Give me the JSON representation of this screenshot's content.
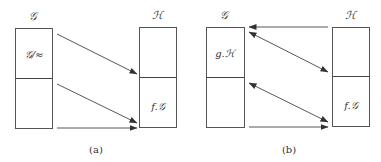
{
  "diagrams": [
    {
      "id": "a",
      "caption": "(a)",
      "left_set": {
        "label": "𝒢",
        "top_label": "𝒢/≈",
        "bottom_label": ""
      },
      "right_set": {
        "label": "ℋ",
        "top_label": "",
        "bottom_label": "f.𝒢"
      },
      "arrows": [
        {
          "from": "left-top",
          "to": "right-divider",
          "direction": "forward"
        },
        {
          "from": "left-divider",
          "to": "right-bottom",
          "direction": "forward"
        },
        {
          "from": "left-bottom",
          "to": "right-bottom",
          "direction": "forward"
        }
      ]
    },
    {
      "id": "b",
      "caption": "(b)",
      "left_set": {
        "label": "𝒢",
        "top_label": "g.ℋ",
        "bottom_label": ""
      },
      "right_set": {
        "label": "ℋ",
        "top_label": "",
        "bottom_label": "f.𝒢"
      },
      "arrows": [
        {
          "from": "right-top",
          "to": "left-top",
          "direction": "backward"
        },
        {
          "from": "left-top",
          "to": "right-divider",
          "direction": "bidirectional"
        },
        {
          "from": "left-divider",
          "to": "right-bottom",
          "direction": "bidirectional"
        },
        {
          "from": "left-bottom",
          "to": "right-bottom",
          "direction": "forward"
        }
      ]
    }
  ],
  "colors": {
    "line": "#444444",
    "text": "#333333",
    "background": "#ffffff"
  }
}
